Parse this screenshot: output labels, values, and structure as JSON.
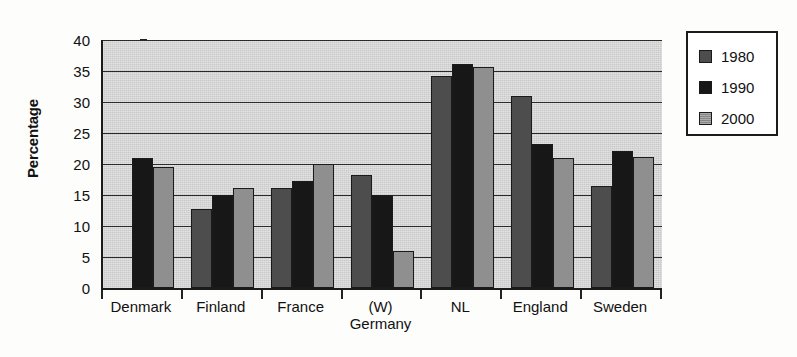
{
  "chart_data": {
    "type": "bar",
    "title": "",
    "xlabel": "",
    "ylabel": "Percentage",
    "ylim": [
      0,
      40
    ],
    "ytick_step": 5,
    "yticks": [
      "40",
      "35",
      "30",
      "25",
      "20",
      "15",
      "10",
      "5",
      "0"
    ],
    "grid": true,
    "legend_position": "right",
    "categories": [
      "Denmark",
      "Finland",
      "France",
      "(W) Germany",
      "NL",
      "England",
      "Sweden"
    ],
    "category_labels": [
      {
        "line1": "Denmark",
        "line2": ""
      },
      {
        "line1": "Finland",
        "line2": ""
      },
      {
        "line1": "France",
        "line2": ""
      },
      {
        "line1": "(W)",
        "line2": "Germany"
      },
      {
        "line1": "NL",
        "line2": ""
      },
      {
        "line1": "England",
        "line2": ""
      },
      {
        "line1": "Sweden",
        "line2": ""
      }
    ],
    "series": [
      {
        "name": "1980",
        "color": "#4d4d4d",
        "values": [
          null,
          12.8,
          16.2,
          18.2,
          34.2,
          31.0,
          16.4
        ]
      },
      {
        "name": "1990",
        "color": "#171717",
        "values": [
          21.0,
          15.0,
          17.2,
          15.0,
          36.2,
          23.2,
          22.1
        ]
      },
      {
        "name": "2000",
        "color": "#8f8f8f",
        "values": [
          19.5,
          16.2,
          20.0,
          6.0,
          35.7,
          21.0,
          21.2
        ]
      }
    ]
  },
  "legend": {
    "items": [
      {
        "label": "1980",
        "swatch": "legend-swatch-1980"
      },
      {
        "label": "1990",
        "swatch": "legend-swatch-1990"
      },
      {
        "label": "2000",
        "swatch": "legend-swatch-2000"
      }
    ]
  },
  "axes": {
    "y_title": "Percentage"
  }
}
